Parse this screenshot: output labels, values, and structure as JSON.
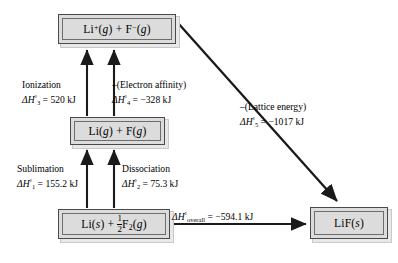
{
  "diagram": {
    "line_color": "#1a1a1a",
    "box_fill": "#dcdcdc",
    "box_border": "#4a4a4a"
  },
  "boxes": {
    "ions": {
      "label": "Li⁺(g) + F⁻(g)",
      "state_gas": "g"
    },
    "atoms": {
      "label": "Li(g) + F(g)"
    },
    "elements": {
      "label": "Li(s) + ½F₂(g)"
    },
    "solid": {
      "label": "LiF(s)"
    }
  },
  "steps": {
    "ionization": {
      "name": "Ionization",
      "symbol": "ΔH°₃",
      "value": "520",
      "unit": "kJ",
      "enthalpy": "ΔH°₃ = 520 kJ"
    },
    "electron_affinity": {
      "name": "–(Electron affinity)",
      "symbol": "ΔH°₄",
      "value": "–328",
      "unit": "kJ",
      "enthalpy": "ΔH°₄ = –328 kJ"
    },
    "lattice_energy": {
      "name": "–(Lattice energy)",
      "symbol": "ΔH°₅",
      "value": "–1017",
      "unit": "kJ",
      "enthalpy": "ΔH°₅ = –1017 kJ"
    },
    "sublimation": {
      "name": "Sublimation",
      "symbol": "ΔH°₁",
      "value": "155.2",
      "unit": "kJ",
      "enthalpy": "ΔH°₁ = 155.2 kJ"
    },
    "dissociation": {
      "name": "Dissociation",
      "symbol": "ΔH°₂",
      "value": "75.3",
      "unit": "kJ",
      "enthalpy": "ΔH°₂ = 75.3 kJ"
    },
    "overall": {
      "name": "ΔH°overall",
      "symbol": "ΔH°overall",
      "value": "–594.1",
      "unit": "kJ",
      "enthalpy": "ΔH°overall = –594.1 kJ"
    }
  }
}
